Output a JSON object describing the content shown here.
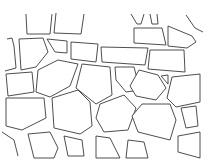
{
  "image": {
    "subject": "stone wall line drawing",
    "background_color": "#ffffff",
    "line_color": "#3a3a3a"
  }
}
